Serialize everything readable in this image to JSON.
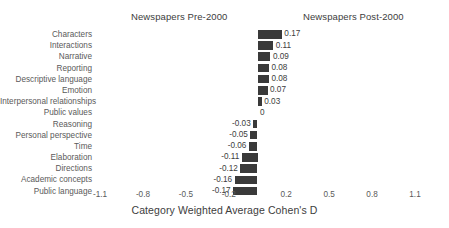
{
  "panels": {
    "left_title": "Newspapers Pre-2000",
    "right_title": "Newspapers Post-2000"
  },
  "axis": {
    "title": "Category Weighted Average Cohen's D",
    "ticks": [
      "-1.1",
      "-0.8",
      "-0.5",
      "-0.2",
      "0.2",
      "0.5",
      "0.8",
      "1.1"
    ]
  },
  "colors": {
    "bar": "#3a3a3a",
    "text": "#3d3d3d",
    "tick_text": "#5a5a5a",
    "background": "#ffffff"
  },
  "chart_data": {
    "type": "bar",
    "orientation": "horizontal",
    "title": "",
    "subtitle": "",
    "xlabel": "Category Weighted Average Cohen's D",
    "ylabel": "",
    "xlim": [
      -1.1,
      1.1
    ],
    "xticks": [
      -1.1,
      -0.8,
      -0.5,
      -0.2,
      0.2,
      0.5,
      0.8,
      1.1
    ],
    "xtick_labels": [
      "-1.1",
      "-0.8",
      "-0.5",
      "-0.2",
      "0.2",
      "0.5",
      "0.8",
      "1.1"
    ],
    "grid": false,
    "legend": null,
    "annotations": [
      "Newspapers Pre-2000",
      "Newspapers Post-2000"
    ],
    "categories": [
      "Characters",
      "Interactions",
      "Narrative",
      "Reporting",
      "Descriptive language",
      "Emotion",
      "Interpersonal relationships",
      "Public values",
      "Reasoning",
      "Personal perspective",
      "Time",
      "Elaboration",
      "Directions",
      "Academic concepts",
      "Public language"
    ],
    "values": [
      0.17,
      0.11,
      0.09,
      0.08,
      0.08,
      0.07,
      0.03,
      0,
      -0.03,
      -0.05,
      -0.06,
      -0.11,
      -0.12,
      -0.16,
      -0.17
    ],
    "value_labels": [
      "0.17",
      "0.11",
      "0.09",
      "0.08",
      "0.08",
      "0.07",
      "0.03",
      "0",
      "-0.03",
      "-0.05",
      "-0.06",
      "-0.11",
      "-0.12",
      "-0.16",
      "-0.17"
    ]
  }
}
